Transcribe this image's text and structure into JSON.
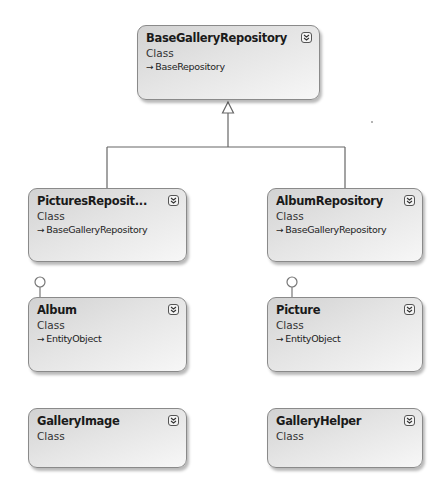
{
  "diagram": {
    "type": "class-diagram",
    "classes": [
      {
        "id": "base_gallery_repository",
        "name": "BaseGalleryRepository",
        "kind": "Class",
        "base": "BaseRepository",
        "base_arrow": "→"
      },
      {
        "id": "pictures_repository",
        "name": "PicturesReposit...",
        "kind": "Class",
        "base": "BaseGalleryRepository",
        "base_arrow": "→"
      },
      {
        "id": "album_repository",
        "name": "AlbumRepository",
        "kind": "Class",
        "base": "BaseGalleryRepository",
        "base_arrow": "→"
      },
      {
        "id": "album",
        "name": "Album",
        "kind": "Class",
        "base": "EntityObject",
        "base_arrow": "→"
      },
      {
        "id": "picture",
        "name": "Picture",
        "kind": "Class",
        "base": "EntityObject",
        "base_arrow": "→"
      },
      {
        "id": "gallery_image",
        "name": "GalleryImage",
        "kind": "Class"
      },
      {
        "id": "gallery_helper",
        "name": "GalleryHelper",
        "kind": "Class"
      }
    ],
    "relationships": [
      {
        "type": "inheritance",
        "from": "PicturesReposit...",
        "to": "BaseGalleryRepository"
      },
      {
        "type": "inheritance",
        "from": "AlbumRepository",
        "to": "BaseGalleryRepository"
      },
      {
        "type": "interface-lollipop",
        "on": "Album"
      },
      {
        "type": "interface-lollipop",
        "on": "Picture"
      }
    ],
    "icons": {
      "expand": "double-chevron-down-icon"
    },
    "colors": {
      "box_border": "#8a8a8a",
      "box_fill_dark": "#d2d2d2",
      "box_fill_light": "#f7f7f7",
      "connector": "#666666"
    }
  }
}
